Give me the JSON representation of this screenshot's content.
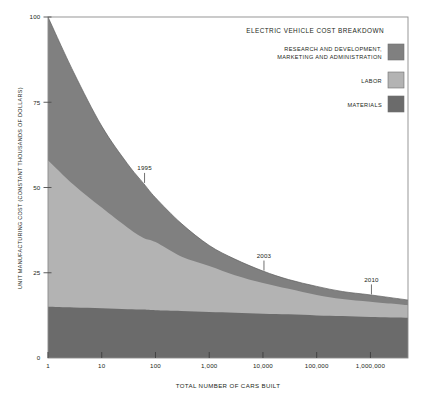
{
  "figure": {
    "background_color": "#ffffff",
    "frame_color": "#8c8c8c"
  },
  "legend": {
    "title": "ELECTRIC VEHICLE COST BREAKDOWN",
    "items": [
      {
        "label_line1": "RESEARCH AND DEVELOPMENT,",
        "label_line2": "MARKETING AND ADMINISTRATION",
        "color": "#808080",
        "swatch_name": "rnd-swatch"
      },
      {
        "label_line1": "LABOR",
        "label_line2": "",
        "color": "#b3b3b3",
        "swatch_name": "labor-swatch"
      },
      {
        "label_line1": "MATERIALS",
        "label_line2": "",
        "color": "#6b6b6b",
        "swatch_name": "materials-swatch"
      }
    ]
  },
  "chart_data": {
    "type": "area",
    "stacked": true,
    "title": "ELECTRIC VEHICLE COST BREAKDOWN",
    "xlabel": "TOTAL NUMBER OF CARS BUILT",
    "ylabel": "UNIT MANUFACTURING COST (CONSTANT THOUSANDS OF DOLLARS)",
    "xscale": "log",
    "xlim": [
      1,
      5000000
    ],
    "ylim": [
      0,
      100
    ],
    "grid": false,
    "legend_position": "top-right inside",
    "xticks": [
      1,
      10,
      100,
      1000,
      10000,
      100000,
      1000000
    ],
    "xticklabels": [
      "1",
      "10",
      "100",
      "1,000",
      "10,000",
      "100,000",
      "1,000,000"
    ],
    "yticks": [
      0,
      25,
      50,
      75,
      100
    ],
    "yticklabels": [
      "0",
      "25",
      "50",
      "75",
      "100"
    ],
    "x": [
      1,
      3,
      10,
      30,
      60,
      100,
      300,
      1000,
      3000,
      10000,
      30000,
      100000,
      300000,
      1000000,
      5000000
    ],
    "series": [
      {
        "name": "MATERIALS",
        "color": "#6b6b6b",
        "values": [
          15.0,
          14.8,
          14.6,
          14.3,
          14.2,
          14.0,
          13.8,
          13.5,
          13.3,
          13.0,
          12.8,
          12.5,
          12.3,
          12.0,
          11.8
        ]
      },
      {
        "name": "LABOR",
        "color": "#b3b3b3",
        "values": [
          43.0,
          36.0,
          29.5,
          24.0,
          21.0,
          20.0,
          16.0,
          13.5,
          11.0,
          9.0,
          7.5,
          6.0,
          5.0,
          4.5,
          3.7
        ]
      },
      {
        "name": "RESEARCH AND DEVELOPMENT, MARKETING AND ADMINISTRATION",
        "color": "#808080",
        "values": [
          42.0,
          33.0,
          23.9,
          18.7,
          16.0,
          13.0,
          9.7,
          6.0,
          4.7,
          3.5,
          2.7,
          2.5,
          2.2,
          2.0,
          1.5
        ]
      }
    ],
    "cumulative_totals": [
      100.0,
      83.6,
      68.0,
      57.0,
      51.2,
      47.0,
      39.5,
      33.0,
      29.0,
      25.5,
      23.0,
      21.0,
      19.5,
      18.5,
      17.0
    ],
    "annotations": [
      {
        "text": "1995",
        "x": 60,
        "y_on_total_curve": 51.2
      },
      {
        "text": "2003",
        "x": 10000,
        "y_on_total_curve": 25.5
      },
      {
        "text": "2010",
        "x": 1000000,
        "y_on_total_curve": 18.5
      }
    ]
  }
}
